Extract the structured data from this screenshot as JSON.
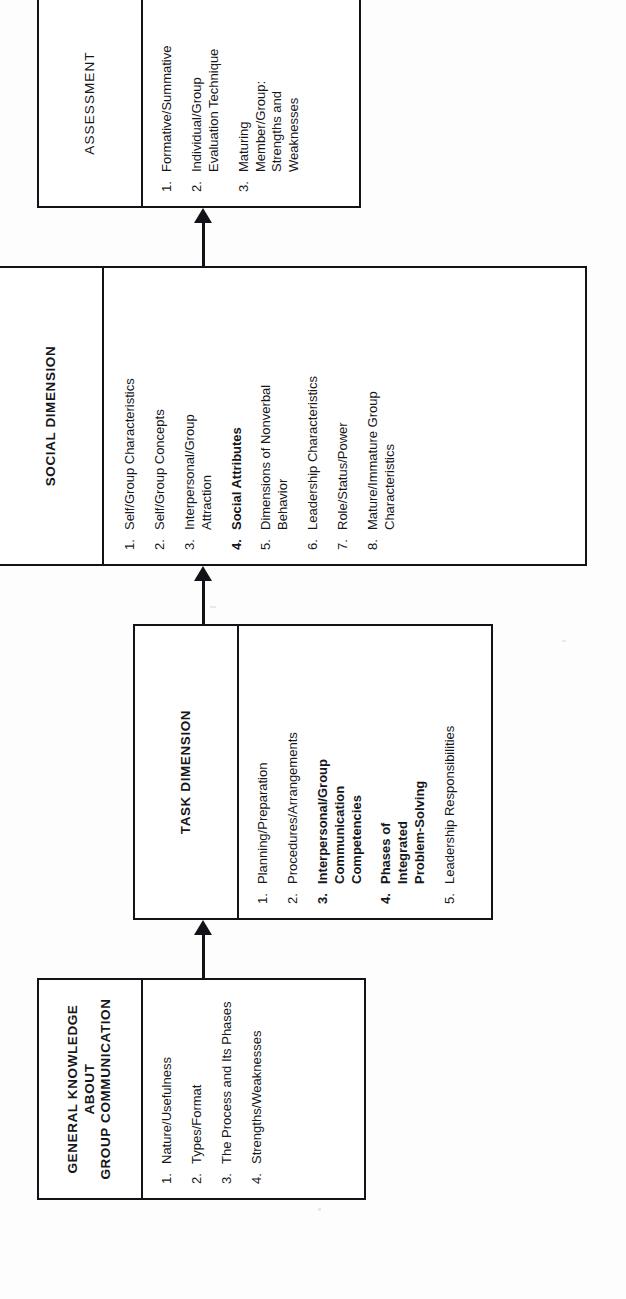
{
  "diagram": {
    "type": "flowchart",
    "orientation": "rotated-90-ccw",
    "ink_color": "#111318",
    "paper_color": "#fdfdfd",
    "nodes": [
      {
        "id": "general-knowledge",
        "header_lines": [
          "GENERAL KNOWLEDGE",
          "ABOUT",
          "GROUP COMMUNICATION"
        ],
        "header_bold": true,
        "items": [
          {
            "num": "1.",
            "text": "Nature/Usefulness",
            "bold": false
          },
          {
            "num": "2.",
            "text": "Types/Format",
            "bold": false
          },
          {
            "num": "3.",
            "text": "The Process and Its Phases",
            "bold": false
          },
          {
            "num": "4.",
            "text": "Strengths/Weaknesses",
            "bold": false
          }
        ]
      },
      {
        "id": "task-dimension",
        "header_lines": [
          "TASK DIMENSION"
        ],
        "header_bold": true,
        "items": [
          {
            "num": "1.",
            "text": "Planning/Preparation",
            "bold": false
          },
          {
            "num": "2.",
            "text": "Procedures/Arrangements",
            "bold": false
          },
          {
            "num": "3.",
            "text": "Interpersonal/Group Communication Competencies",
            "bold": true
          },
          {
            "num": "4.",
            "text": "Phases of Integrated Problem-Solving",
            "bold": true
          },
          {
            "num": "5.",
            "text": "Leadership Responsibilities",
            "bold": false
          }
        ]
      },
      {
        "id": "social-dimension",
        "header_lines": [
          "SOCIAL DIMENSION"
        ],
        "header_bold": true,
        "items": [
          {
            "num": "1.",
            "text": "Self/Group Characteristics",
            "bold": false
          },
          {
            "num": "2.",
            "text": "Self/Group Concepts",
            "bold": false
          },
          {
            "num": "3.",
            "text": "Interpersonal/Group Attraction",
            "bold": false
          },
          {
            "num": "4.",
            "text": "Social Attributes",
            "bold": true
          },
          {
            "num": "5.",
            "text": "Dimensions of Nonverbal Behavior",
            "bold": false
          },
          {
            "num": "6.",
            "text": "Leadership Characteristics",
            "bold": false
          },
          {
            "num": "7.",
            "text": "Role/Status/Power",
            "bold": false
          },
          {
            "num": "8.",
            "text": "Mature/Immature Group Characteristics",
            "bold": false
          }
        ]
      },
      {
        "id": "assessment",
        "header_lines": [
          "ASSESSMENT"
        ],
        "header_bold": false,
        "items": [
          {
            "num": "1.",
            "text": "Formative/Summative",
            "bold": false
          },
          {
            "num": "2.",
            "text": "Individual/Group Evaluation Technique",
            "bold": false
          },
          {
            "num": "3.",
            "text": "Maturing Member/Group: Strengths and Weaknesses",
            "bold": false
          }
        ]
      }
    ],
    "edges": [
      {
        "from": "general-knowledge",
        "to": "task-dimension",
        "style": "solid-arrow"
      },
      {
        "from": "task-dimension",
        "to": "social-dimension",
        "style": "solid-arrow"
      },
      {
        "from": "social-dimension",
        "to": "assessment",
        "style": "solid-arrow"
      }
    ]
  }
}
